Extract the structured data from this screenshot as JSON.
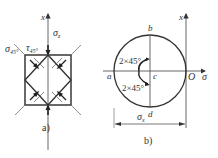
{
  "panel_a": {
    "caption": "a)",
    "axis_label": "x",
    "sigma_z_label": "σ",
    "sigma_z_sub": "z",
    "sigma_45_label": "σ",
    "sigma_45_sub": "45°",
    "tau_45_label": "τ",
    "tau_45_sub": "45°"
  },
  "panel_b": {
    "caption": "b)",
    "axis_x_label": "x",
    "axis_sigma_label": "σ",
    "origin_label": "O",
    "point_a": "a",
    "point_b": "b",
    "point_c": "c",
    "point_d": "d",
    "angle_upper": "2×45°",
    "angle_lower": "2×45°",
    "dimension_label": "σ",
    "dimension_sub": "x"
  },
  "colors": {
    "line": "#444444",
    "text": "#333333"
  }
}
